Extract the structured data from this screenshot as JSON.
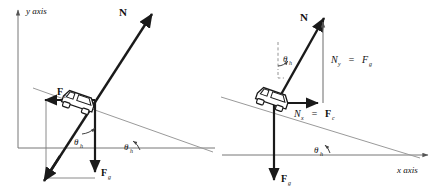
{
  "figure": {
    "title": "",
    "axes": {
      "y_label": "y axis",
      "x_label": "x axis"
    },
    "left_diagram": {
      "name": "vector-parallelogram-diagram",
      "labels": {
        "normal_force": "N",
        "centripetal_force": "F",
        "centripetal_force_sub": "c",
        "gravity_force": "F",
        "gravity_force_sub": "g",
        "bank_angle_inner": "θ",
        "bank_angle_inner_sub": "h",
        "bank_angle_ground": "θ",
        "bank_angle_ground_sub": "h"
      }
    },
    "right_diagram": {
      "name": "vector-components-diagram",
      "labels": {
        "normal_force": "N",
        "vertical_component": "N",
        "vertical_component_sub": "y",
        "equals_sign_vertical": "=",
        "gravity_force_rhs": "F",
        "gravity_force_rhs_sub": "g",
        "horizontal_component": "N",
        "horizontal_component_sub": "x",
        "equals_sign_horizontal": "=",
        "centripetal_force_rhs": "F",
        "centripetal_force_rhs_sub": "c",
        "gravity_force": "F",
        "gravity_force_sub": "g",
        "bank_angle_top": "θ",
        "bank_angle_top_sub": "h",
        "bank_angle_ground": "θ",
        "bank_angle_ground_sub": "h"
      }
    },
    "colors": {
      "stroke_dark": "#1a1a1a",
      "stroke_thin": "#8a8a8a",
      "background": "#ffffff"
    }
  }
}
